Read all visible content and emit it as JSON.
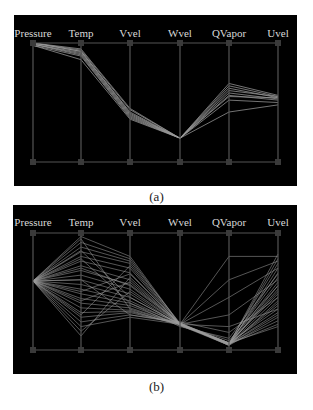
{
  "figure": {
    "panels": [
      {
        "id": "a",
        "caption": "(a)"
      },
      {
        "id": "b",
        "caption": "(b)"
      }
    ]
  },
  "colors": {
    "background": "#000000",
    "axis": "#555555",
    "marker": "#3a3a3a",
    "line": "#9a9a9a",
    "label": "#d8d8d8"
  },
  "chart_data": [
    {
      "type": "parallel-coordinates",
      "title": "(a)",
      "axes": [
        "Pressure",
        "Temp",
        "Vvel",
        "Wvel",
        "QVapor",
        "Uvel"
      ],
      "range": [
        0,
        1
      ],
      "note": "Normalized values (1 = top of axis, 0 = bottom). Tightly clustered selection.",
      "polylines": [
        [
          1.0,
          0.95,
          0.45,
          0.2,
          0.66,
          0.56
        ],
        [
          1.0,
          0.94,
          0.44,
          0.2,
          0.64,
          0.55
        ],
        [
          1.0,
          0.93,
          0.42,
          0.2,
          0.62,
          0.54
        ],
        [
          1.0,
          0.93,
          0.41,
          0.2,
          0.6,
          0.55
        ],
        [
          0.99,
          0.92,
          0.4,
          0.2,
          0.58,
          0.53
        ],
        [
          0.99,
          0.91,
          0.39,
          0.2,
          0.56,
          0.52
        ],
        [
          0.99,
          0.9,
          0.38,
          0.2,
          0.55,
          0.54
        ],
        [
          0.98,
          0.89,
          0.37,
          0.2,
          0.52,
          0.5
        ],
        [
          0.98,
          0.86,
          0.36,
          0.2,
          0.42,
          0.48
        ]
      ]
    },
    {
      "type": "parallel-coordinates",
      "title": "(b)",
      "axes": [
        "Pressure",
        "Temp",
        "Vvel",
        "Wvel",
        "QVapor",
        "Uvel"
      ],
      "range": [
        0,
        1
      ],
      "note": "Normalized values (1 = top of axis, 0 = bottom). Pressure constant ~0.59; Temp spread full range; Wvel converges ~0.22; QVapor mostly near 0.05; Uvel spread 0.2-0.82.",
      "polylines": [
        [
          0.59,
          0.97,
          0.8,
          0.22,
          0.05,
          0.82
        ],
        [
          0.59,
          0.92,
          0.78,
          0.22,
          0.05,
          0.78
        ],
        [
          0.59,
          0.88,
          0.76,
          0.23,
          0.06,
          0.74
        ],
        [
          0.59,
          0.84,
          0.74,
          0.22,
          0.04,
          0.7
        ],
        [
          0.59,
          0.8,
          0.7,
          0.21,
          0.05,
          0.66
        ],
        [
          0.59,
          0.76,
          0.66,
          0.22,
          0.06,
          0.62
        ],
        [
          0.59,
          0.72,
          0.6,
          0.22,
          0.05,
          0.58
        ],
        [
          0.59,
          0.68,
          0.56,
          0.23,
          0.04,
          0.55
        ],
        [
          0.59,
          0.64,
          0.52,
          0.22,
          0.05,
          0.52
        ],
        [
          0.59,
          0.6,
          0.48,
          0.21,
          0.06,
          0.48
        ],
        [
          0.59,
          0.56,
          0.45,
          0.22,
          0.05,
          0.45
        ],
        [
          0.59,
          0.52,
          0.42,
          0.22,
          0.04,
          0.42
        ],
        [
          0.59,
          0.48,
          0.4,
          0.23,
          0.05,
          0.38
        ],
        [
          0.59,
          0.44,
          0.38,
          0.22,
          0.06,
          0.35
        ],
        [
          0.59,
          0.4,
          0.36,
          0.22,
          0.05,
          0.32
        ],
        [
          0.59,
          0.36,
          0.34,
          0.21,
          0.04,
          0.28
        ],
        [
          0.59,
          0.32,
          0.33,
          0.22,
          0.05,
          0.25
        ],
        [
          0.59,
          0.28,
          0.32,
          0.22,
          0.05,
          0.22
        ],
        [
          0.59,
          0.24,
          0.3,
          0.23,
          0.06,
          0.2
        ],
        [
          0.59,
          0.2,
          0.28,
          0.22,
          0.05,
          0.3
        ],
        [
          0.59,
          0.16,
          0.5,
          0.22,
          0.05,
          0.4
        ],
        [
          0.59,
          0.12,
          0.62,
          0.22,
          0.06,
          0.5
        ],
        [
          0.59,
          0.95,
          0.35,
          0.22,
          0.3,
          0.6
        ],
        [
          0.59,
          0.85,
          0.45,
          0.22,
          0.45,
          0.7
        ],
        [
          0.59,
          0.7,
          0.55,
          0.22,
          0.6,
          0.76
        ],
        [
          0.59,
          0.5,
          0.65,
          0.22,
          0.8,
          0.8
        ],
        [
          0.59,
          0.3,
          0.72,
          0.22,
          0.2,
          0.35
        ],
        [
          0.59,
          0.6,
          0.3,
          0.24,
          0.15,
          0.45
        ],
        [
          0.59,
          0.78,
          0.4,
          0.2,
          0.1,
          0.65
        ],
        [
          0.59,
          0.42,
          0.58,
          0.22,
          0.08,
          0.55
        ]
      ]
    }
  ]
}
